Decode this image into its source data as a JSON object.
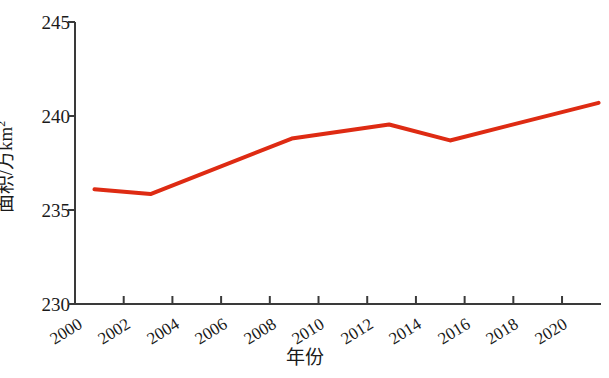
{
  "chart_data": {
    "type": "line",
    "title": "",
    "xlabel": "年份",
    "ylabel": "面积/万km",
    "ylabel_exponent": "2",
    "xlim": [
      2000,
      2021.6
    ],
    "ylim": [
      230,
      245
    ],
    "grid": false,
    "legend": null,
    "line_color": "#de2b13",
    "line_width_px": 4,
    "axis_color": "#3a3a3a",
    "x_tick_labels": [
      "2000",
      "2002",
      "2004",
      "2006",
      "2008",
      "2010",
      "2012",
      "2014",
      "2016",
      "2018",
      "2020"
    ],
    "x_tick_values": [
      2000,
      2002,
      2004,
      2006,
      2008,
      2010,
      2012,
      2014,
      2016,
      2018,
      2020
    ],
    "y_tick_labels": [
      "245",
      "240",
      "235",
      "230"
    ],
    "y_tick_values": [
      245,
      240,
      235,
      230
    ],
    "x": [
      2000.8,
      2003.1,
      2008.9,
      2012.9,
      2015.4,
      2021.5
    ],
    "values": [
      236.1,
      235.85,
      238.8,
      239.55,
      238.7,
      240.7
    ],
    "series": [
      {
        "name": "面积",
        "x": [
          2000.8,
          2003.1,
          2008.9,
          2012.9,
          2015.4,
          2021.5
        ],
        "values": [
          236.1,
          235.85,
          238.8,
          239.55,
          238.7,
          240.7
        ]
      }
    ]
  }
}
